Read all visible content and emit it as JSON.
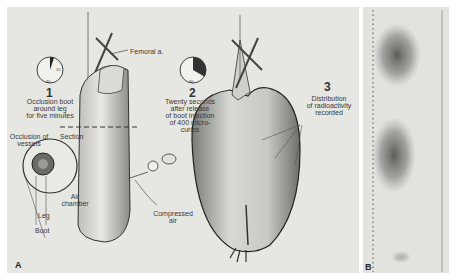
{
  "figure": {
    "panel_a": {
      "letter": "A",
      "step_1": {
        "number": "1",
        "caption": "Occlusion boot\naround leg\nfor five minutes",
        "clock": {
          "label_right": "15",
          "label_bottom": "30",
          "filled_fraction": 0.05
        }
      },
      "step_2": {
        "number": "2",
        "caption": "Twenty seconds\nafter release\nof boot injection\nof 400 micro-\ncuries",
        "clock": {
          "label_bottom": "30",
          "filled_fraction": 0.33
        }
      },
      "step_3": {
        "number": "3",
        "caption": "Distribution\nof radioactivity\nrecorded"
      },
      "labels": {
        "femoral": "Femoral a.",
        "occlusion_vessels": "Occlusion of\nvessels",
        "section": "Section",
        "air_chamber": "Air\nchamber",
        "leg": "Leg",
        "boot": "Boot",
        "compressed_air": "Compressed\nair"
      }
    },
    "panel_b": {
      "letter": "B",
      "description": "scintigram strip with two dark radioactivity regions"
    }
  }
}
